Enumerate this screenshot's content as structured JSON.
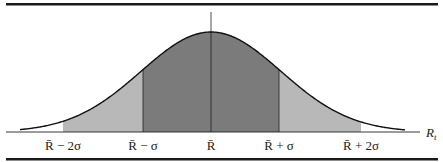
{
  "figure": {
    "type": "normal-distribution-diagram",
    "axis_label": "R",
    "axis_label_subscript": "t",
    "center_label": "R̄",
    "tick_labels": [
      {
        "id": "minus-2sigma",
        "base": "R̄",
        "op": "−",
        "coef": "2",
        "sym": "σ",
        "text": "R̄ − 2σ"
      },
      {
        "id": "minus-1sigma",
        "base": "R̄",
        "op": "−",
        "coef": "",
        "sym": "σ",
        "text": "R̄ − σ"
      },
      {
        "id": "mean",
        "base": "R̄",
        "op": "",
        "coef": "",
        "sym": "",
        "text": "R̄"
      },
      {
        "id": "plus-1sigma",
        "base": "R̄",
        "op": "+",
        "coef": "",
        "sym": "σ",
        "text": "R̄ + σ"
      },
      {
        "id": "plus-2sigma",
        "base": "R̄",
        "op": "+",
        "coef": "2",
        "sym": "σ",
        "text": "R̄ + 2σ"
      }
    ],
    "regions": [
      {
        "name": "one-sigma-band",
        "from_sigma": -1,
        "to_sigma": 1,
        "color": "#7b7b7b"
      },
      {
        "name": "two-sigma-band",
        "from_sigma": -2,
        "to_sigma": 2,
        "color": "#b8b8b8"
      }
    ],
    "colors": {
      "rule": "#1a1a1a",
      "curve": "#1a1a1a",
      "dark_fill": "#7b7b7b",
      "light_fill": "#b8b8b8",
      "background": "#ffffff"
    }
  }
}
